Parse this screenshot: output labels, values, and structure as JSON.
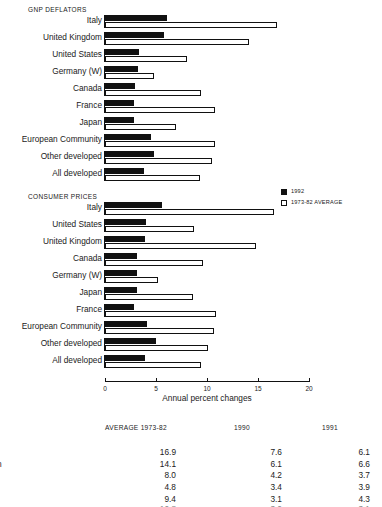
{
  "axis": {
    "caption": "Annual percent changes",
    "ticks": [
      {
        "value": 0,
        "label": "0"
      },
      {
        "value": 5,
        "label": "5"
      },
      {
        "value": 10,
        "label": "10"
      },
      {
        "value": 15,
        "label": "15"
      },
      {
        "value": 20,
        "label": "20"
      }
    ],
    "min": 0,
    "max": 20
  },
  "legend": {
    "items": [
      {
        "label": "1992",
        "swatch": "filled-square-icon",
        "color": "#111111"
      },
      {
        "label": "1973-82 AVERAGE",
        "swatch": "hollow-square-icon",
        "color": "#ffffff"
      }
    ]
  },
  "panels": [
    {
      "id": "gnp",
      "title": "GNP DEFLATORS",
      "labels": [
        "Italy",
        "United Kingdom",
        "United States",
        "Germany (W)",
        "Canada",
        "France",
        "Japan",
        "European Community",
        "Other developed",
        "All developed"
      ]
    },
    {
      "id": "cpi",
      "title": "CONSUMER PRICES",
      "labels": [
        "Italy",
        "United States",
        "United Kingdom",
        "Canada",
        "Germany (W)",
        "Japan",
        "France",
        "European Community",
        "Other developed",
        "All developed"
      ]
    }
  ],
  "table": {
    "headers": {
      "label": "",
      "col0": "AVERAGE 1973-82",
      "col1": "1990",
      "col2": "1991"
    },
    "rows": [
      {
        "label": "EFLATORS",
        "heading": true,
        "col0": "",
        "col1": "",
        "col2": ""
      },
      {
        "label": "",
        "heading": false,
        "col0": "16.9",
        "col1": "7.6",
        "col2": "6.1"
      },
      {
        "label": "d Kingdom",
        "heading": false,
        "col0": "14.1",
        "col1": "6.1",
        "col2": "6.6"
      },
      {
        "label": "d States",
        "heading": false,
        "col0": "8.0",
        "col1": "4.2",
        "col2": "3.7"
      },
      {
        "label": "any (W)",
        "heading": false,
        "col0": "4.8",
        "col1": "3.4",
        "col2": "3.9"
      },
      {
        "label": "da",
        "heading": false,
        "col0": "9.4",
        "col1": "3.1",
        "col2": "4.3"
      }
    ],
    "clipped_row": {
      "label": "",
      "col0": "10.8",
      "col1": "3.0",
      "col2": "3.1"
    }
  },
  "chart_data": [
    {
      "type": "bar",
      "orientation": "horizontal",
      "title": "GNP DEFLATORS",
      "subtitle": "",
      "xlabel": "Annual percent changes",
      "ylabel": "",
      "xlim": [
        0,
        20
      ],
      "xticks": [
        0,
        5,
        10,
        15,
        20
      ],
      "grid": false,
      "legend_position": "right",
      "categories": [
        "Italy",
        "United Kingdom",
        "United States",
        "Germany (W)",
        "Canada",
        "France",
        "Japan",
        "European Community",
        "Other developed",
        "All developed"
      ],
      "series": [
        {
          "name": "1992",
          "values": [
            6.1,
            5.8,
            3.3,
            3.2,
            2.9,
            2.8,
            2.8,
            4.5,
            4.8,
            3.8
          ]
        },
        {
          "name": "1973-82 AVERAGE",
          "values": [
            16.9,
            14.1,
            8.0,
            4.8,
            9.4,
            10.8,
            7.0,
            10.8,
            10.5,
            9.3
          ]
        }
      ]
    },
    {
      "type": "bar",
      "orientation": "horizontal",
      "title": "CONSUMER PRICES",
      "subtitle": "",
      "xlabel": "Annual percent changes",
      "ylabel": "",
      "xlim": [
        0,
        20
      ],
      "xticks": [
        0,
        5,
        10,
        15,
        20
      ],
      "grid": false,
      "legend_position": "right",
      "categories": [
        "Italy",
        "United States",
        "United Kingdom",
        "Canada",
        "Germany (W)",
        "Japan",
        "France",
        "European Community",
        "Other developed",
        "All developed"
      ],
      "series": [
        {
          "name": "1992",
          "values": [
            5.6,
            4.0,
            3.9,
            3.1,
            3.1,
            3.1,
            2.8,
            4.1,
            5.0,
            3.9
          ]
        },
        {
          "name": "1973-82 AVERAGE",
          "values": [
            16.6,
            8.7,
            14.8,
            9.6,
            5.2,
            8.6,
            10.9,
            10.7,
            10.1,
            9.4
          ]
        }
      ]
    }
  ]
}
